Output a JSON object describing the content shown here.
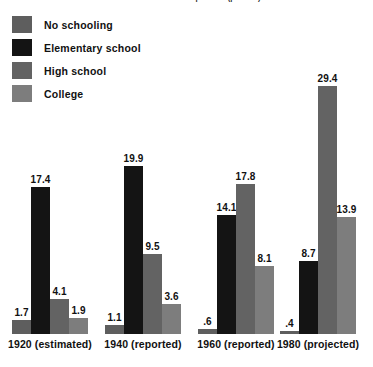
{
  "chart_data": {
    "type": "bar",
    "title": "Attainment of Adult Population (percent)",
    "xlabel": "",
    "ylabel": "",
    "grid": false,
    "legend_position": "top-left",
    "ylim": [
      0,
      29.4
    ],
    "categories": [
      "1920 (estimated)",
      "1940 (reported)",
      "1960 (reported)",
      "1980 (projected)"
    ],
    "series": [
      {
        "name": "No schooling",
        "color": "#5e5e5e",
        "values": [
          1.7,
          1.1,
          0.6,
          0.4
        ],
        "labels": [
          "1.7",
          "1.1",
          ".6",
          ".4"
        ]
      },
      {
        "name": "Elementary school",
        "color": "#141414",
        "values": [
          17.4,
          19.9,
          14.1,
          8.7
        ],
        "labels": [
          "17.4",
          "19.9",
          "14.1",
          "8.7"
        ]
      },
      {
        "name": "High school",
        "color": "#636363",
        "values": [
          4.1,
          9.5,
          17.8,
          29.4
        ],
        "labels": [
          "4.1",
          "9.5",
          "17.8",
          "29.4"
        ]
      },
      {
        "name": "College",
        "color": "#7d7d7d",
        "values": [
          1.9,
          3.6,
          8.1,
          13.9
        ],
        "labels": [
          "1.9",
          "3.6",
          "8.1",
          "13.9"
        ]
      }
    ]
  },
  "legend": {
    "items": [
      {
        "label": "No schooling",
        "color": "#5e5e5e"
      },
      {
        "label": "Elementary school",
        "color": "#141414"
      },
      {
        "label": "High school",
        "color": "#636363"
      },
      {
        "label": "College",
        "color": "#7d7d7d"
      }
    ]
  }
}
